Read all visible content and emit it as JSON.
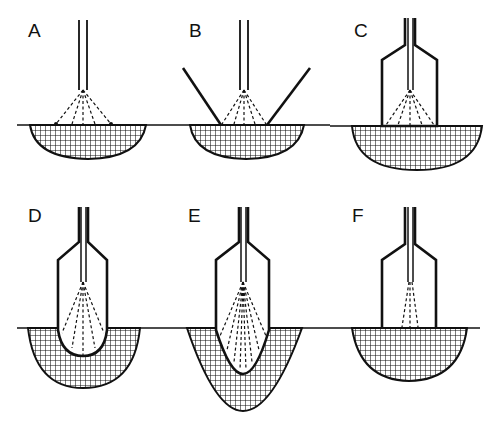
{
  "figure": {
    "panels": [
      {
        "id": "A",
        "label": "A",
        "description": "Bare nozzle above surface, spray cone onto flat surface, shallow bowl-shaped hatched region"
      },
      {
        "id": "B",
        "label": "B",
        "description": "Nozzle with angled side walls, spray onto surface, bowl-shaped hatched region"
      },
      {
        "id": "C",
        "label": "C",
        "description": "Nozzle in enclosed housing resting on surface, hatched bowl region"
      },
      {
        "id": "D",
        "label": "D",
        "description": "Housing with rounded bottom penetrating into hatched region"
      },
      {
        "id": "E",
        "label": "E",
        "description": "Housing with pointed bottom penetrating deeply, dense spray, deep V-shaped hatched region"
      },
      {
        "id": "F",
        "label": "F",
        "description": "Housing on surface with narrow spray, hatched bowl region"
      }
    ],
    "colors": {
      "line": "#111111",
      "background": "#ffffff"
    }
  }
}
